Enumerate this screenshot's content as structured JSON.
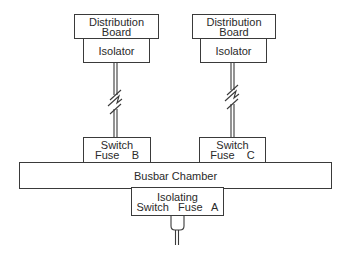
{
  "diagram": {
    "type": "electrical-distribution-schematic",
    "nodes": {
      "db_left": {
        "line1": "Distribution",
        "line2": "Board"
      },
      "iso_left": {
        "label": "Isolator"
      },
      "db_right": {
        "line1": "Distribution",
        "line2": "Board"
      },
      "iso_right": {
        "label": "Isolator"
      },
      "sf_b": {
        "line1": "Switch",
        "line2": "Fuse    B"
      },
      "sf_c": {
        "line1": "Switch",
        "line2": "Fuse    C"
      },
      "busbar": {
        "label": "Busbar Chamber"
      },
      "isf_a": {
        "line1": "Isolating",
        "line2": "Switch   Fuse   A"
      }
    },
    "edges": [
      {
        "from": "Isolator (left)",
        "to": "Switch Fuse B",
        "style": "double-line with break symbol"
      },
      {
        "from": "Isolator (right)",
        "to": "Switch Fuse C",
        "style": "double-line with break symbol"
      },
      {
        "from": "Switch Fuse B",
        "to": "Busbar Chamber"
      },
      {
        "from": "Switch Fuse C",
        "to": "Busbar Chamber"
      },
      {
        "from": "Busbar Chamber",
        "to": "Isolating Switch Fuse A"
      },
      {
        "from": "Isolating Switch Fuse A",
        "to": "incoming supply cable",
        "style": "cable gland"
      }
    ],
    "colors": {
      "line": "#3a3a3a",
      "background": "#ffffff"
    }
  }
}
